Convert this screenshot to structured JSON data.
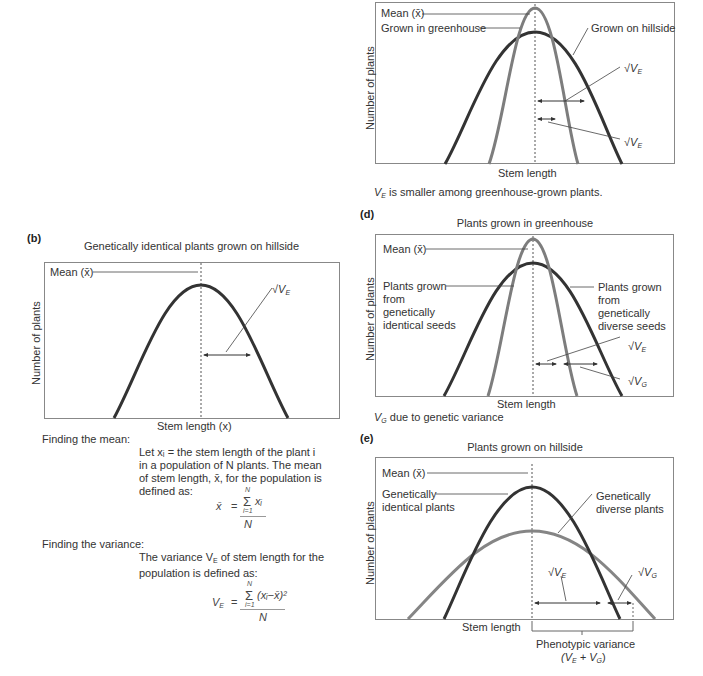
{
  "colors": {
    "dark_curve": "#333333",
    "gray_curve": "#858585",
    "frame": "#888888",
    "text": "#333333"
  },
  "panel_c": {
    "ylabel": "Number of plants",
    "xlabel": "Stem length",
    "labels": {
      "mean": "Mean (x̄)",
      "greenhouse": "Grown in greenhouse",
      "hillside": "Grown on hillside",
      "sqrt_ve_1": "√V",
      "sqrt_ve_2": "√V",
      "sub_e": "E"
    },
    "caption_v": "V",
    "caption_sub": "E",
    "caption_rest": " is smaller among greenhouse-grown plants."
  },
  "panel_b": {
    "letter": "(b)",
    "title": "Genetically identical plants grown on hillside",
    "ylabel": "Number of plants",
    "xlabel": "Stem length (x)",
    "labels": {
      "mean": "Mean (x̄)",
      "sqrt_ve": "√V",
      "sub_e": "E"
    },
    "finding_mean": "Finding the mean:",
    "mean_text": "Let xᵢ = the stem length of the plant i in a population of N plants. The mean of stem length, x̄, for the population is defined as:",
    "mean_formula": {
      "lhs": "x̄",
      "eq": "=",
      "sum_top": "N",
      "sum": "Σ",
      "term": "xᵢ",
      "sum_bottom": "i=1",
      "denominator": "N"
    },
    "finding_variance": "Finding the variance:",
    "variance_text_1": "The variance V",
    "variance_text_sub": "E",
    "variance_text_2": " of stem length for the population is defined as:",
    "variance_formula": {
      "lhs": "V",
      "lhs_sub": "E",
      "eq": "=",
      "sum_top": "N",
      "sum": "Σ",
      "term": "(xᵢ−x̄)²",
      "sum_bottom": "i=1",
      "denominator": "N"
    }
  },
  "panel_d": {
    "letter": "(d)",
    "title": "Plants grown in greenhouse",
    "ylabel": "Number of plants",
    "xlabel": "Stem length",
    "labels": {
      "mean": "Mean (x̄)",
      "identical": "Plants grown from genetically identical seeds",
      "diverse": "Plants grown from genetically diverse seeds",
      "sqrt_ve": "√V",
      "sub_e": "E",
      "sqrt_vg": "√V",
      "sub_g": "G"
    },
    "caption_v": "V",
    "caption_sub": "G",
    "caption_rest": " due to genetic variance"
  },
  "panel_e": {
    "letter": "(e)",
    "title": "Plants grown on hillside",
    "ylabel": "Number of plants",
    "xlabel": "Stem length",
    "labels": {
      "mean": "Mean (x̄)",
      "identical": "Genetically identical plants",
      "diverse": "Genetically diverse plants",
      "sqrt_ve": "√V",
      "sub_e": "E",
      "sqrt_vg": "√V",
      "sub_g": "G"
    },
    "phenotypic": "Phenotypic variance",
    "phenotypic_formula": "(V",
    "pf_sub_e": "E",
    "pf_plus": " + V",
    "pf_sub_g": "G",
    "pf_close": ")"
  }
}
